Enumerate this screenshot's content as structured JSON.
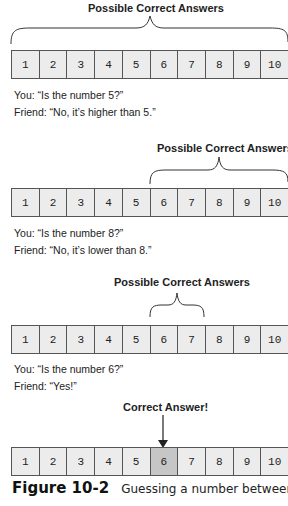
{
  "cells": [
    "1",
    "2",
    "3",
    "4",
    "5",
    "6",
    "7",
    "8",
    "9",
    "10"
  ],
  "colors": {
    "cell_bg": "#ececec",
    "highlight_bg": "#c6c6c6",
    "border": "#555555"
  },
  "steps": [
    {
      "label": "Possible Correct Answers",
      "range": [
        1,
        10
      ],
      "you": "You: “Is the number 5?”",
      "friend": "Friend: “No, it’s higher than 5.”"
    },
    {
      "label": "Possible Correct Answers",
      "range": [
        6,
        10
      ],
      "you": "You: “Is the number 8?”",
      "friend": "Friend: “No, it’s lower than 8.”"
    },
    {
      "label": "Possible Correct Answers",
      "range": [
        6,
        7
      ],
      "you": "You: “Is the number 6?”",
      "friend": "Friend: “Yes!”"
    },
    {
      "label": "Correct Answer!",
      "answer": 6
    }
  ],
  "caption": {
    "number": "Figure 10-2",
    "text": "Guessing a number between"
  }
}
